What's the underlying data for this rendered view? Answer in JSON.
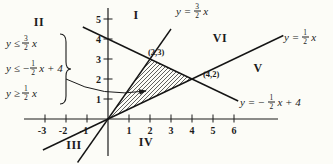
{
  "figure": {
    "background": "#fcfcf7",
    "ink": "#1b1b1b"
  },
  "inequalities": {
    "rows": [
      {
        "pre": "y ≤ ",
        "num": "3",
        "den": "2",
        "post": " x"
      },
      {
        "pre": "y ≤ −",
        "num": "1",
        "den": "2",
        "post": " x + 4"
      },
      {
        "pre": "y ≥ ",
        "num": "1",
        "den": "2",
        "post": " x"
      }
    ]
  },
  "equations": {
    "top": {
      "pre": "y = ",
      "num": "3",
      "den": "2",
      "post": " x"
    },
    "right": {
      "pre": "y = ",
      "num": "1",
      "den": "2",
      "post": " x"
    },
    "bottom": {
      "pre": "y = − ",
      "num": "1",
      "den": "2",
      "post": " x + 4"
    }
  },
  "chart_data": {
    "type": "line",
    "xlim": [
      -4,
      8.5
    ],
    "ylim": [
      -2.3,
      5.6
    ],
    "x_ticks": [
      -3,
      -2,
      -1,
      1,
      2,
      3,
      4,
      5,
      6
    ],
    "y_ticks": [
      1,
      2,
      3,
      4,
      5
    ],
    "grid": false,
    "legend": false,
    "series": [
      {
        "name": "y = 3/2 x",
        "slope": 1.5,
        "intercept": 0,
        "x_range": [
          -1.45,
          3.0
        ]
      },
      {
        "name": "y = 1/2 x",
        "slope": 0.5,
        "intercept": 0,
        "x_range": [
          -3.1,
          8.35
        ]
      },
      {
        "name": "y = -1/2 x + 4",
        "slope": -0.5,
        "intercept": 4,
        "x_range": [
          -1.2,
          6.2
        ]
      }
    ],
    "shaded_region": {
      "vertices": [
        [
          0,
          0
        ],
        [
          2,
          3
        ],
        [
          4,
          2
        ]
      ],
      "style": "diagonal-hatch"
    },
    "labeled_points": [
      {
        "label": "(2,3)",
        "x": 2,
        "y": 3,
        "label_px": [
          148,
          47
        ]
      },
      {
        "label": "(4,2)",
        "x": 4,
        "y": 2,
        "label_px": [
          203,
          69
        ]
      }
    ],
    "region_labels": [
      {
        "label": "I",
        "cx": 136,
        "cy": 15
      },
      {
        "label": "II",
        "cx": 39,
        "cy": 22
      },
      {
        "label": "III",
        "cx": 74,
        "cy": 145
      },
      {
        "label": "IV",
        "cx": 146,
        "cy": 142
      },
      {
        "label": "V",
        "cx": 258,
        "cy": 68
      },
      {
        "label": "VI",
        "cx": 220,
        "cy": 38
      }
    ],
    "annotation_arrow": {
      "from_px": [
        66,
        79
      ],
      "to_px": [
        146,
        91
      ]
    }
  }
}
